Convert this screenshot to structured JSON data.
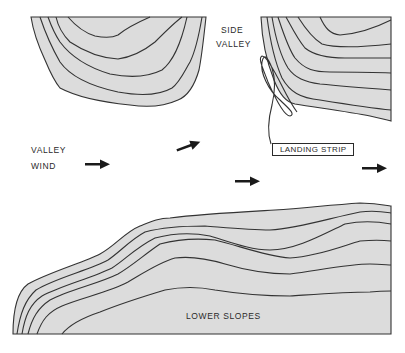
{
  "labels": {
    "side_valley_line1": "SIDE",
    "side_valley_line2": "VALLEY",
    "valley_wind_line1": "VALLEY",
    "valley_wind_line2": "WIND",
    "landing_strip": "LANDING STRIP",
    "lower_slopes": "LOWER SLOPES"
  },
  "colors": {
    "terrain_fill": "#dcdcdc",
    "contour_line": "#333333",
    "arrow": "#1a1a1a",
    "background": "#ffffff"
  },
  "features": {
    "terrain_areas": [
      "upper-left-ridge",
      "upper-right-ridge",
      "lower-slopes"
    ],
    "wind_arrows": 4,
    "flight_path": "loop-pattern-descending-to-landing-strip"
  }
}
